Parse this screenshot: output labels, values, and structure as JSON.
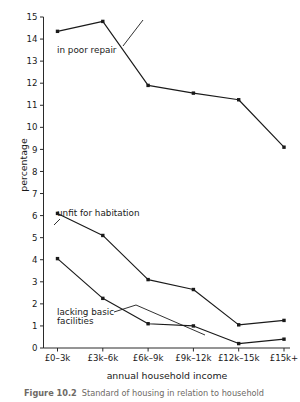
{
  "figure": {
    "caption_label": "Figure 10.2",
    "caption_text": "Standard of housing in relation to household"
  },
  "chart_data": {
    "type": "line",
    "title": "",
    "xlabel": "annual household income",
    "ylabel": "percentage",
    "categories": [
      "£0–3k",
      "£3k–6k",
      "£6k–9k",
      "£9k–12k",
      "£12k–15k",
      "£15k+"
    ],
    "ylim": [
      0,
      15
    ],
    "yticks": [
      0,
      1,
      2,
      3,
      4,
      5,
      6,
      7,
      8,
      9,
      10,
      11,
      12,
      13,
      14,
      15
    ],
    "ytick_labels": [
      "0",
      "1",
      "2",
      "3",
      "4",
      "5",
      "6",
      "7",
      "8",
      "9",
      "10",
      "11",
      "12",
      "13",
      "14",
      "15"
    ],
    "grid": false,
    "legend_position": "inline-annotations",
    "marker": "square",
    "line_color": "#1a1a1a",
    "series": [
      {
        "name": "in poor repair",
        "label": "in poor repair",
        "values": [
          14.35,
          14.8,
          11.9,
          11.55,
          11.25,
          9.1
        ]
      },
      {
        "name": "unfit for habitation",
        "label": "unfit for habitation",
        "values": [
          6.1,
          5.1,
          3.1,
          2.65,
          1.05,
          1.25
        ]
      },
      {
        "name": "lacking basic facilities",
        "label": "lacking basic facilities",
        "values": [
          4.05,
          2.25,
          1.1,
          1.0,
          0.2,
          0.4
        ]
      }
    ],
    "annotations": [
      {
        "text": "in poor repair",
        "series": "in poor repair"
      },
      {
        "text": "unfit for habitation",
        "series": "unfit for habitation"
      },
      {
        "text": "lacking basic",
        "series": "lacking basic facilities"
      },
      {
        "text": "facilities",
        "series": "lacking basic facilities"
      }
    ]
  }
}
